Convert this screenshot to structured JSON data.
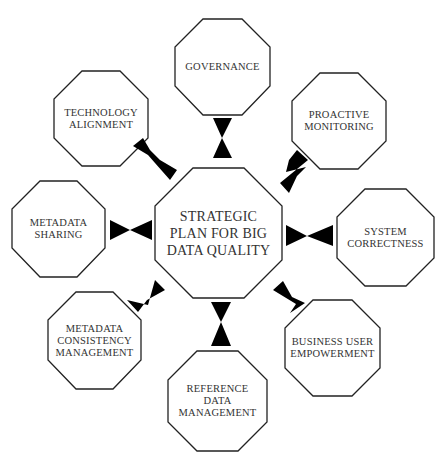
{
  "diagram": {
    "type": "hub-and-spoke",
    "center": {
      "label": "STRATEGIC\nPLAN FOR BIG\nDATA QUALITY"
    },
    "nodes": [
      {
        "id": "governance",
        "label": "GOVERNANCE"
      },
      {
        "id": "proactive-monitoring",
        "label": "PROACTIVE\nMONITORING"
      },
      {
        "id": "system-correctness",
        "label": "SYSTEM\nCORRECTNESS"
      },
      {
        "id": "business-user-empowerment",
        "label": "BUSINESS USER\nEMPOWERMENT"
      },
      {
        "id": "reference-data-management",
        "label": "REFERENCE\nDATA\nMANAGEMENT"
      },
      {
        "id": "metadata-consistency-management",
        "label": "METADATA\nCONSISTENCY\nMANAGEMENT"
      },
      {
        "id": "metadata-sharing",
        "label": "METADATA\nSHARING"
      },
      {
        "id": "technology-alignment",
        "label": "TECHNOLOGY\nALIGNMENT"
      }
    ],
    "connector": "bowtie",
    "colors": {
      "stroke": "#222222",
      "fill": "#ffffff",
      "connector": "#000000",
      "text": "#333333"
    }
  }
}
